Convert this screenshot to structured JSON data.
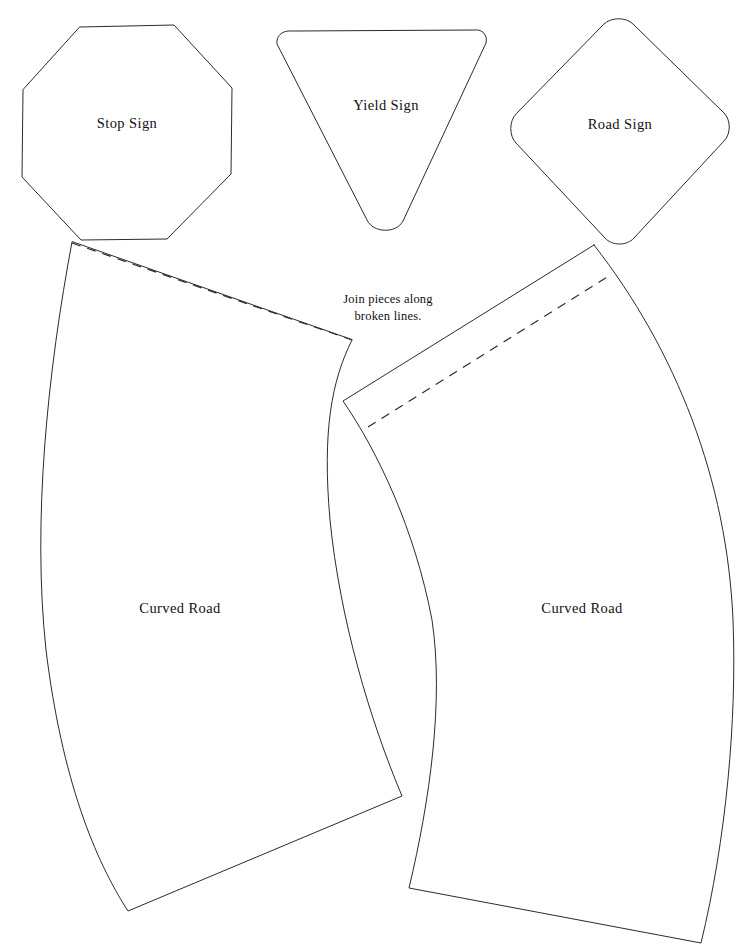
{
  "page": {
    "width": 748,
    "height": 945,
    "background_color": "#ffffff",
    "stroke_color": "#2b2b2b",
    "text_color": "#111111"
  },
  "instruction": {
    "line1": "Join pieces along",
    "line2": "broken lines.",
    "x": 388,
    "y": 303
  },
  "pieces": [
    {
      "id": "stop-sign",
      "label": "Stop Sign",
      "shape": "octagon",
      "label_x": 127,
      "label_y": 125,
      "path": "M 80,27 L 174,25 L 232,88 L 231,174 L 167,239 L 81,240 L 22,177 L 23,90 Z"
    },
    {
      "id": "yield-sign",
      "label": "Yield Sign",
      "shape": "rounded-triangle-down",
      "label_x": 386,
      "label_y": 107,
      "path": "M 289,31 C 282,31 276,36 277,44 L 367,220 C 373,233 396,234 403,221 L 486,43 C 488,35 482,29 475,30 L 295,31 Z"
    },
    {
      "id": "road-sign",
      "label": "Road Sign",
      "shape": "rounded-diamond",
      "label_x": 620,
      "label_y": 126,
      "path": "M 604,24 C 611,17 626,17 633,24 L 724,113 C 731,120 731,134 724,141 L 634,238 C 627,246 612,246 605,238 L 516,143 C 509,136 509,121 516,114 Z"
    },
    {
      "id": "curved-road-left",
      "label": "Curved Road",
      "shape": "curved-strip",
      "label_x": 180,
      "label_y": 610,
      "path": "M 72,242 C 48,370 32,520 46,650 C 62,780 95,860 128,911 L 402,796 C 370,720 340,620 330,520 C 322,430 332,380 352,340 Z",
      "fold_line": "M 72,243 L 352,340"
    },
    {
      "id": "curved-road-right",
      "label": "Curved Road",
      "shape": "curved-strip",
      "label_x": 582,
      "label_y": 610,
      "path": "M 594,245 L 343,401 C 378,452 415,530 432,620 C 444,700 430,800 409,888 L 701,943 C 726,840 737,720 733,620 C 727,480 676,350 594,245 Z",
      "fold_line": "M 368,427 L 612,274"
    }
  ]
}
